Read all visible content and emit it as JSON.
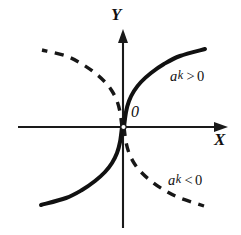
{
  "figure": {
    "background_color": "#ffffff",
    "ink_color": "#111111"
  },
  "axes": {
    "x_label": "X",
    "y_label": "Y",
    "origin_label": "0",
    "x_axis": {
      "y_px": 127,
      "x_start_px": 18,
      "x_end_px": 228,
      "arrow": "right"
    },
    "y_axis": {
      "x_px": 123,
      "y_start_px": 228,
      "y_end_px": 30,
      "arrow": "up"
    }
  },
  "labels": {
    "positive": {
      "variable": "a",
      "exponent": "k",
      "relation": ">",
      "value": "0"
    },
    "negative": {
      "variable": "a",
      "exponent": "k",
      "relation": "<",
      "value": "0"
    }
  },
  "chart_data": {
    "type": "line",
    "title": "",
    "xlabel": "X",
    "ylabel": "Y",
    "grid": false,
    "legend_position": "inline-annotation",
    "origin_label": "0",
    "xlim": [
      -110,
      110
    ],
    "ylim": [
      -105,
      100
    ],
    "annotations": [
      {
        "text": "a k > 0",
        "x_px": 170,
        "y_px": 69,
        "refers_to": "solid branches"
      },
      {
        "text": "a k < 0",
        "x_px": 168,
        "y_px": 173,
        "refers_to": "dashed branches"
      },
      {
        "text": "0",
        "x_px": 131,
        "y_px": 104,
        "refers_to": "origin"
      }
    ],
    "series": [
      {
        "name": "ak > 0 (quadrant I)",
        "style": "solid",
        "color": "#111111",
        "points_px": [
          [
            124,
            127
          ],
          [
            126,
            112
          ],
          [
            129,
            101
          ],
          [
            134,
            91
          ],
          [
            141,
            82
          ],
          [
            151,
            73
          ],
          [
            164,
            64
          ],
          [
            180,
            56
          ],
          [
            205,
            49
          ]
        ]
      },
      {
        "name": "ak > 0 (quadrant III)",
        "style": "solid",
        "color": "#111111",
        "points_px": [
          [
            122,
            127
          ],
          [
            120,
            142
          ],
          [
            117,
            153
          ],
          [
            112,
            163
          ],
          [
            105,
            172
          ],
          [
            95,
            181
          ],
          [
            82,
            190
          ],
          [
            66,
            198
          ],
          [
            41,
            205
          ]
        ]
      },
      {
        "name": "ak < 0 (quadrant II)",
        "style": "dashed",
        "color": "#171717",
        "points_px": [
          [
            122,
            127
          ],
          [
            120,
            112
          ],
          [
            117,
            101
          ],
          [
            112,
            91
          ],
          [
            105,
            82
          ],
          [
            95,
            73
          ],
          [
            82,
            64
          ],
          [
            66,
            56
          ],
          [
            42,
            50
          ]
        ]
      },
      {
        "name": "ak < 0 (quadrant IV)",
        "style": "dashed",
        "color": "#171717",
        "points_px": [
          [
            124,
            127
          ],
          [
            126,
            142
          ],
          [
            129,
            153
          ],
          [
            134,
            163
          ],
          [
            141,
            172
          ],
          [
            151,
            181
          ],
          [
            164,
            190
          ],
          [
            180,
            198
          ],
          [
            204,
            206
          ]
        ]
      }
    ]
  }
}
